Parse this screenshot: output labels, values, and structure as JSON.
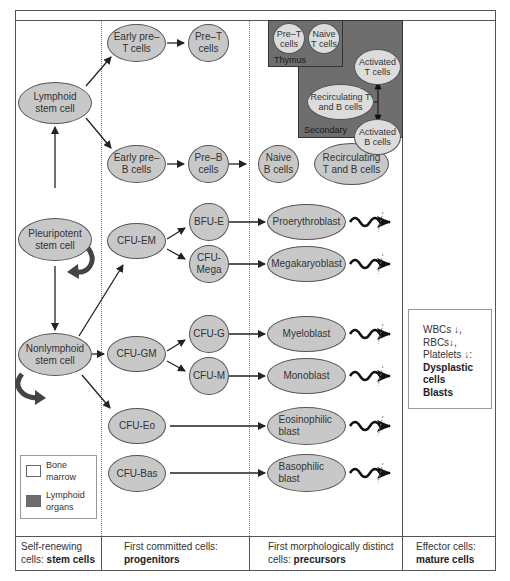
{
  "columns": [
    {
      "label": "Self-renewing cells:",
      "bold": "stem cells"
    },
    {
      "label": "First committed cells:",
      "bold": "progenitors"
    },
    {
      "label": "First morphologically distinct cells:",
      "bold": "precursors"
    },
    {
      "label": "Effector cells:",
      "bold": "mature cells"
    }
  ],
  "stem_cells": {
    "lymphoid": "Lymphoid stem cell",
    "pleuripotent": "Pleuripotent stem cell",
    "nonlymphoid": "Nonlymphoid stem cell"
  },
  "lymphoid_lineage": {
    "early_pre_t": "Early pre– T cells",
    "pre_t": "Pre–T cells",
    "early_pre_b": "Early pre– B cells",
    "pre_b": "Pre–B cells",
    "naive_b": "Naive B cells",
    "recirculating": "Recirculating T and B cells"
  },
  "thymus": {
    "label": "Thymus",
    "pre_t": "Pre–T cells",
    "naive_t": "Naive T cells"
  },
  "secondary": {
    "label": "Secondary",
    "activated_t": "Activated T cells",
    "recirculating": "Recirculating T and B cells",
    "activated_b": "Activated B cells"
  },
  "progenitors": {
    "cfu_em": "CFU-EM",
    "bfu_e": "BFU-E",
    "cfu_mega": "CFU- Mega",
    "cfu_gm": "CFU-GM",
    "cfu_g": "CFU-G",
    "cfu_m": "CFU-M",
    "cfu_eo": "CFU-Eo",
    "cfu_bas": "CFU-Bas"
  },
  "precursors": {
    "proerythroblast": "Proerythroblast",
    "megakaryoblast": "Megakaryoblast",
    "myeloblast": "Myeloblast",
    "monoblast": "Monoblast",
    "eosinophilic": "Eosinophilic blast",
    "basophilic": "Basophilic blast"
  },
  "info_box": {
    "line1": "WBCs ↓,",
    "line2": "RBCs↓,",
    "line3": "Platelets ↓:",
    "bold1": "Dysplastic",
    "bold2": "cells",
    "bold3": "Blasts"
  },
  "legend": {
    "bone_marrow": "Bone marrow",
    "lymphoid_organs": "Lymphoid organs"
  },
  "colors": {
    "cell_fill": "#c8c8c8",
    "lymphoid_region": "#6e6e6e",
    "line": "#555555"
  }
}
